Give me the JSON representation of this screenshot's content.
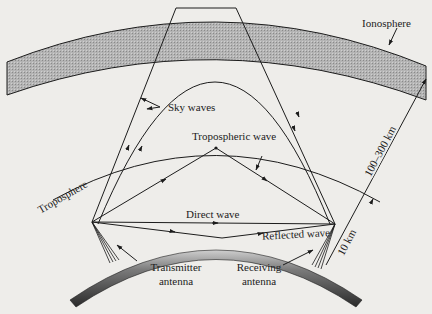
{
  "diagram": {
    "type": "radio wave propagation modes",
    "labels": {
      "ionosphere": "Ionosphere",
      "sky_waves": "Sky waves",
      "tropospheric_wave": "Tropospheric wave",
      "troposphere": "Troposphere",
      "direct_wave": "Direct wave",
      "reflected_wave": "Reflected wave",
      "transmitter_line1": "Transmitter",
      "transmitter_line2": "antenna",
      "receiver_line1": "Receiving",
      "receiver_line2": "antenna",
      "height_ionosphere": "100–300 km",
      "height_troposphere": "10 km"
    },
    "colors": {
      "background": "#eeedea",
      "ink": "#1c1c1c",
      "ionosphere_fill": "#a9a9a9",
      "earth_fill": "#555555"
    }
  }
}
